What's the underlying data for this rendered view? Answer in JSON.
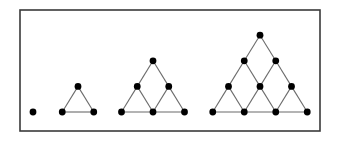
{
  "figure": {
    "background_color": "#ffffff",
    "frame": {
      "name": "outer-border",
      "x": 20,
      "y": 10,
      "width": 300,
      "height": 121,
      "stroke_color": "#3a3a3a",
      "stroke_width": 1.6,
      "fill": "#ffffff"
    },
    "style": {
      "dot_color": "#000000",
      "dot_radius": 3.4,
      "line_color": "#6b6b6b",
      "line_width": 1.1,
      "baseline_y": 112,
      "row_spacing": 25.6,
      "dot_spacing": 31.5
    },
    "figures": [
      {
        "name": "triangular-number-1",
        "index": 1,
        "term_label": "1",
        "rows": 1,
        "dot_count": 1,
        "apex_x": 33,
        "apex_y": 112
      },
      {
        "name": "triangular-number-3",
        "index": 2,
        "term_label": "3",
        "rows": 2,
        "dot_count": 3,
        "apex_x": 78,
        "apex_y": 86.4
      },
      {
        "name": "triangular-number-6",
        "index": 3,
        "term_label": "6",
        "rows": 3,
        "dot_count": 6,
        "apex_x": 153,
        "apex_y": 60.8
      },
      {
        "name": "triangular-number-10",
        "index": 4,
        "term_label": "10",
        "rows": 4,
        "dot_count": 10,
        "apex_x": 260,
        "apex_y": 35.2
      }
    ]
  },
  "chart_data": {
    "type": "scatter",
    "xlabel": "",
    "ylabel": "",
    "categories": [
      "1",
      "2",
      "3",
      "4"
    ],
    "values": [
      1,
      3,
      6,
      10
    ],
    "series": [
      {
        "name": "dots per figure",
        "values": [
          1,
          3,
          6,
          10
        ]
      },
      {
        "name": "rows per figure",
        "values": [
          1,
          2,
          3,
          4
        ]
      }
    ],
    "annotations": [
      "Figure 1: a single dot",
      "Figure 2: a 2-row triangle of 3 dots",
      "Figure 3: a 3-row triangle of 6 dots",
      "Figure 4: a 4-row triangle of 10 dots"
    ],
    "grid": false,
    "legend": "none"
  }
}
